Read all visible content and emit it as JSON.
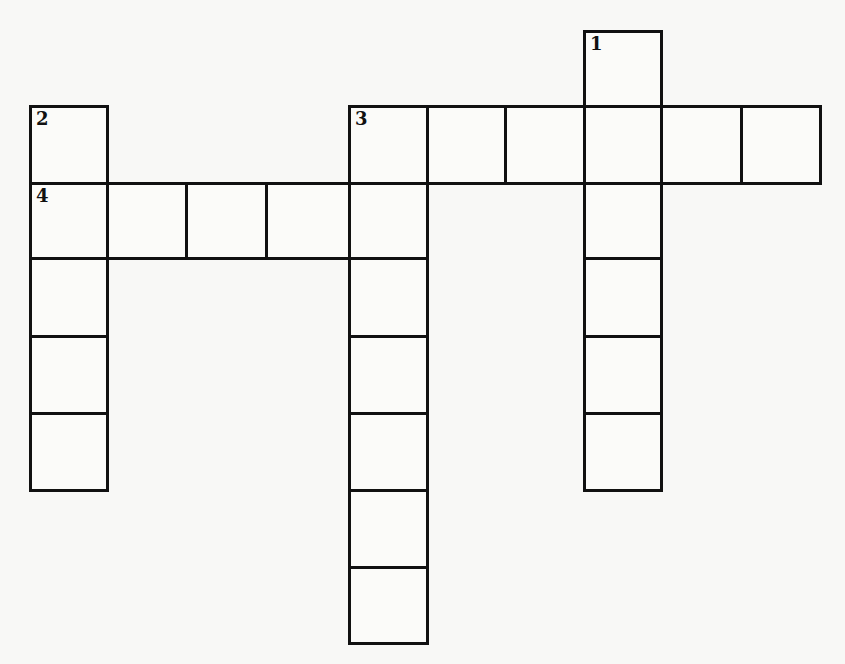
{
  "puzzle": {
    "type": "crossword",
    "colors": {
      "background": "#f8f8f6",
      "cell_fill": "#fbfbf9",
      "grid_line": "#111111",
      "number_text": "#111111"
    },
    "grid_geometry": {
      "col_edges_px": [
        30,
        107,
        186,
        266,
        349,
        427,
        505,
        584,
        661,
        741,
        820
      ],
      "row_edges_px": [
        31,
        106,
        183,
        258,
        336,
        413,
        490,
        567,
        643
      ]
    },
    "entries": [
      {
        "number": "1",
        "direction": "down",
        "length": 6,
        "start_col": 7,
        "start_row": 0
      },
      {
        "number": "2",
        "direction": "down",
        "length": 5,
        "start_col": 0,
        "start_row": 1
      },
      {
        "number": "3",
        "direction": "across",
        "length": 6,
        "start_col": 4,
        "start_row": 1
      },
      {
        "number": "3",
        "direction": "down",
        "length": 7,
        "start_col": 4,
        "start_row": 1
      },
      {
        "number": "4",
        "direction": "across",
        "length": 5,
        "start_col": 0,
        "start_row": 2
      }
    ],
    "cells": [
      {
        "id": "r0c7",
        "row": 0,
        "col": 7,
        "number": "1",
        "value": ""
      },
      {
        "id": "r1c0",
        "row": 1,
        "col": 0,
        "number": "2",
        "value": ""
      },
      {
        "id": "r1c4",
        "row": 1,
        "col": 4,
        "number": "3",
        "value": ""
      },
      {
        "id": "r1c5",
        "row": 1,
        "col": 5,
        "number": "",
        "value": ""
      },
      {
        "id": "r1c6",
        "row": 1,
        "col": 6,
        "number": "",
        "value": ""
      },
      {
        "id": "r1c7",
        "row": 1,
        "col": 7,
        "number": "",
        "value": ""
      },
      {
        "id": "r1c8",
        "row": 1,
        "col": 8,
        "number": "",
        "value": ""
      },
      {
        "id": "r1c9",
        "row": 1,
        "col": 9,
        "number": "",
        "value": ""
      },
      {
        "id": "r2c0",
        "row": 2,
        "col": 0,
        "number": "4",
        "value": ""
      },
      {
        "id": "r2c1",
        "row": 2,
        "col": 1,
        "number": "",
        "value": ""
      },
      {
        "id": "r2c2",
        "row": 2,
        "col": 2,
        "number": "",
        "value": ""
      },
      {
        "id": "r2c3",
        "row": 2,
        "col": 3,
        "number": "",
        "value": ""
      },
      {
        "id": "r2c4",
        "row": 2,
        "col": 4,
        "number": "",
        "value": ""
      },
      {
        "id": "r2c7",
        "row": 2,
        "col": 7,
        "number": "",
        "value": ""
      },
      {
        "id": "r3c0",
        "row": 3,
        "col": 0,
        "number": "",
        "value": ""
      },
      {
        "id": "r3c4",
        "row": 3,
        "col": 4,
        "number": "",
        "value": ""
      },
      {
        "id": "r3c7",
        "row": 3,
        "col": 7,
        "number": "",
        "value": ""
      },
      {
        "id": "r4c0",
        "row": 4,
        "col": 0,
        "number": "",
        "value": ""
      },
      {
        "id": "r4c4",
        "row": 4,
        "col": 4,
        "number": "",
        "value": ""
      },
      {
        "id": "r4c7",
        "row": 4,
        "col": 7,
        "number": "",
        "value": ""
      },
      {
        "id": "r5c0",
        "row": 5,
        "col": 0,
        "number": "",
        "value": ""
      },
      {
        "id": "r5c4",
        "row": 5,
        "col": 4,
        "number": "",
        "value": ""
      },
      {
        "id": "r5c7",
        "row": 5,
        "col": 7,
        "number": "",
        "value": ""
      },
      {
        "id": "r6c4",
        "row": 6,
        "col": 4,
        "number": "",
        "value": ""
      },
      {
        "id": "r7c4",
        "row": 7,
        "col": 4,
        "number": "",
        "value": ""
      }
    ]
  }
}
